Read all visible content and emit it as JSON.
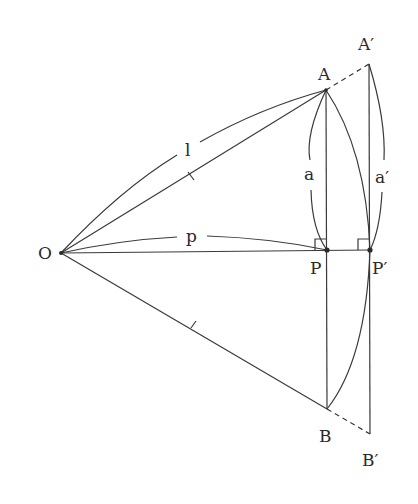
{
  "diagram": {
    "points": {
      "O": {
        "label": "O"
      },
      "A": {
        "label": "A"
      },
      "A_prime": {
        "label": "A′"
      },
      "P": {
        "label": "P"
      },
      "P_prime": {
        "label": "P′"
      },
      "B": {
        "label": "B"
      },
      "B_prime": {
        "label": "B′"
      }
    },
    "segment_labels": {
      "l": "l",
      "p": "p",
      "a": "a",
      "a_prime": "a′"
    },
    "colors": {
      "stroke": "#3a3a3a",
      "text": "#2a2a2a",
      "background": "#ffffff"
    }
  }
}
